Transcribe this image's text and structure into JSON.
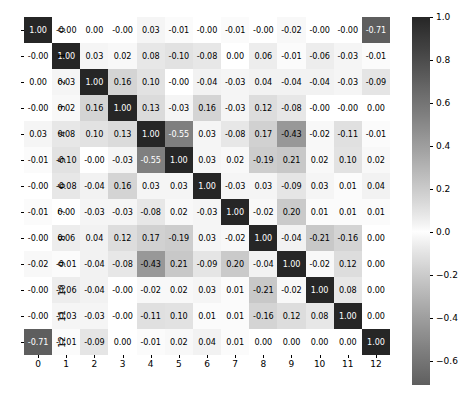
{
  "chart_data": {
    "type": "heatmap",
    "title": "",
    "xlabel": "",
    "ylabel": "",
    "grid": false,
    "legend_position": "right",
    "colormap": "diverging-gray",
    "colorbar": {
      "ticks": [
        1.0,
        0.8,
        0.6,
        0.4,
        0.2,
        0.0,
        -0.2,
        -0.4,
        -0.6
      ],
      "tick_labels": [
        "1.0",
        "0.8",
        "0.6",
        "0.4",
        "0.2",
        "0.0",
        "−0.2",
        "−0.4",
        "−0.6"
      ],
      "vmin": -0.71,
      "vmax": 1.0
    },
    "x_tick_labels": [
      "0",
      "1",
      "2",
      "3",
      "4",
      "5",
      "6",
      "7",
      "8",
      "9",
      "10",
      "11",
      "12"
    ],
    "y_tick_labels": [
      "0",
      "1",
      "2",
      "3",
      "4",
      "5",
      "6",
      "7",
      "8",
      "9",
      "10",
      "11",
      "12"
    ],
    "annotation_format": "%.2f",
    "values": [
      [
        1.0,
        -0.0,
        0.0,
        -0.0,
        0.03,
        -0.01,
        -0.0,
        -0.01,
        -0.0,
        -0.02,
        -0.0,
        -0.0,
        -0.71
      ],
      [
        -0.0,
        1.0,
        0.03,
        0.02,
        0.08,
        -0.1,
        -0.08,
        0.0,
        0.06,
        -0.01,
        -0.06,
        -0.03,
        -0.01
      ],
      [
        0.0,
        0.03,
        1.0,
        0.16,
        0.1,
        -0.0,
        -0.04,
        -0.03,
        0.04,
        -0.04,
        -0.04,
        -0.03,
        -0.09
      ],
      [
        -0.0,
        0.02,
        0.16,
        1.0,
        0.13,
        -0.03,
        0.16,
        -0.03,
        0.12,
        -0.08,
        -0.0,
        -0.0,
        0.0
      ],
      [
        0.03,
        0.08,
        0.1,
        0.13,
        1.0,
        -0.55,
        0.03,
        -0.08,
        0.17,
        -0.43,
        -0.02,
        -0.11,
        -0.01
      ],
      [
        -0.01,
        -0.1,
        -0.0,
        -0.03,
        -0.55,
        1.0,
        0.03,
        0.02,
        -0.19,
        0.21,
        0.02,
        0.1,
        0.02
      ],
      [
        -0.0,
        -0.08,
        -0.04,
        0.16,
        0.03,
        0.03,
        1.0,
        -0.03,
        0.03,
        -0.09,
        0.03,
        0.01,
        0.04
      ],
      [
        -0.01,
        0.0,
        -0.03,
        -0.03,
        -0.08,
        0.02,
        -0.03,
        1.0,
        -0.02,
        0.2,
        0.01,
        0.01,
        0.01
      ],
      [
        -0.0,
        0.06,
        0.04,
        0.12,
        0.17,
        -0.19,
        0.03,
        -0.02,
        1.0,
        -0.04,
        -0.21,
        -0.16,
        0.0
      ],
      [
        -0.02,
        -0.01,
        -0.04,
        -0.08,
        -0.43,
        0.21,
        -0.09,
        0.2,
        -0.04,
        1.0,
        -0.02,
        0.12,
        0.0
      ],
      [
        -0.0,
        -0.06,
        -0.04,
        -0.0,
        -0.02,
        0.02,
        0.03,
        0.01,
        -0.21,
        -0.02,
        1.0,
        0.08,
        0.0
      ],
      [
        -0.0,
        -0.03,
        -0.03,
        -0.0,
        -0.11,
        0.1,
        0.01,
        0.01,
        -0.16,
        0.12,
        0.08,
        1.0,
        0.0
      ],
      [
        -0.71,
        -0.01,
        -0.09,
        0.0,
        -0.01,
        0.02,
        0.04,
        0.01,
        0.0,
        0.0,
        0.0,
        0.0,
        1.0
      ]
    ],
    "cell_labels": [
      [
        "1.00",
        "-0.00",
        "0.00",
        "-0.00",
        "0.03",
        "-0.01",
        "-0.00",
        "-0.01",
        "-0.00",
        "-0.02",
        "-0.00",
        "-0.00",
        "-0.71"
      ],
      [
        "-0.00",
        "1.00",
        "0.03",
        "0.02",
        "0.08",
        "-0.10",
        "-0.08",
        "0.00",
        "0.06",
        "-0.01",
        "-0.06",
        "-0.03",
        "-0.01"
      ],
      [
        "0.00",
        "0.03",
        "1.00",
        "0.16",
        "0.10",
        "-0.00",
        "-0.04",
        "-0.03",
        "0.04",
        "-0.04",
        "-0.04",
        "-0.03",
        "-0.09"
      ],
      [
        "-0.00",
        "0.02",
        "0.16",
        "1.00",
        "0.13",
        "-0.03",
        "0.16",
        "-0.03",
        "0.12",
        "-0.08",
        "-0.00",
        "-0.00",
        "0.00"
      ],
      [
        "0.03",
        "0.08",
        "0.10",
        "0.13",
        "1.00",
        "-0.55",
        "0.03",
        "-0.08",
        "0.17",
        "-0.43",
        "-0.02",
        "-0.11",
        "-0.01"
      ],
      [
        "-0.01",
        "-0.10",
        "-0.00",
        "-0.03",
        "-0.55",
        "1.00",
        "0.03",
        "0.02",
        "-0.19",
        "0.21",
        "0.02",
        "0.10",
        "0.02"
      ],
      [
        "-0.00",
        "-0.08",
        "-0.04",
        "0.16",
        "0.03",
        "0.03",
        "1.00",
        "-0.03",
        "0.03",
        "-0.09",
        "0.03",
        "0.01",
        "0.04"
      ],
      [
        "-0.01",
        "0.00",
        "-0.03",
        "-0.03",
        "-0.08",
        "0.02",
        "-0.03",
        "1.00",
        "-0.02",
        "0.20",
        "0.01",
        "0.01",
        "0.01"
      ],
      [
        "-0.00",
        "0.06",
        "0.04",
        "0.12",
        "0.17",
        "-0.19",
        "0.03",
        "-0.02",
        "1.00",
        "-0.04",
        "-0.21",
        "-0.16",
        "0.00"
      ],
      [
        "-0.02",
        "-0.01",
        "-0.04",
        "-0.08",
        "-0.43",
        "0.21",
        "-0.09",
        "0.20",
        "-0.04",
        "1.00",
        "-0.02",
        "0.12",
        "0.00"
      ],
      [
        "-0.00",
        "-0.06",
        "-0.04",
        "-0.00",
        "-0.02",
        "0.02",
        "0.03",
        "0.01",
        "-0.21",
        "-0.02",
        "1.00",
        "0.08",
        "0.00"
      ],
      [
        "-0.00",
        "-0.03",
        "-0.03",
        "-0.00",
        "-0.11",
        "0.10",
        "0.01",
        "0.01",
        "-0.16",
        "0.12",
        "0.08",
        "1.00",
        "0.00"
      ],
      [
        "-0.71",
        "-0.01",
        "-0.09",
        "0.00",
        "-0.01",
        "0.02",
        "0.04",
        "0.01",
        "0.00",
        "0.00",
        "0.00",
        "0.00",
        "1.00"
      ]
    ]
  },
  "colors": {
    "background": "#ffffff",
    "tick": "#000000",
    "text_dark": "#000000",
    "text_light": "#ffffff",
    "cmap_pos_max": "#262626",
    "cmap_zero": "#ffffff",
    "cmap_neg_max": "#6e6e6e"
  }
}
